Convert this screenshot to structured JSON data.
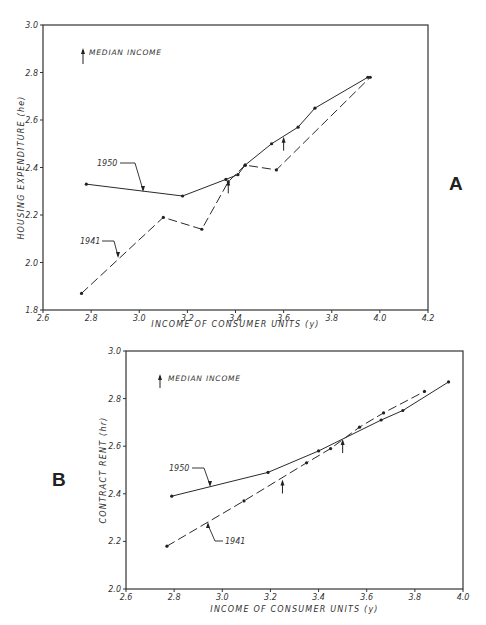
{
  "chart_data": [
    {
      "panel": "A",
      "type": "line",
      "title": "",
      "xlabel": "INCOME OF CONSUMER UNITS (y)",
      "ylabel": "HOUSING EXPENDITURE (he)",
      "xlim": [
        2.6,
        4.2
      ],
      "ylim": [
        1.8,
        3.0
      ],
      "xticks": [
        "2.6",
        "2.8",
        "3.0",
        "3.2",
        "3.4",
        "3.6",
        "3.8",
        "4.0",
        "4.2"
      ],
      "yticks": [
        "1.8",
        "2.0",
        "2.2",
        "2.4",
        "2.6",
        "2.8",
        "3.0"
      ],
      "grid": false,
      "legend": {
        "text": "MEDIAN INCOME",
        "position": "top-left",
        "marker": "up-arrow"
      },
      "series": [
        {
          "name": "1950",
          "style": "solid",
          "x": [
            2.78,
            3.18,
            3.36,
            3.41,
            3.44,
            3.55,
            3.66,
            3.73,
            3.95
          ],
          "y": [
            2.33,
            2.28,
            2.35,
            2.37,
            2.41,
            2.5,
            2.57,
            2.65,
            2.78
          ]
        },
        {
          "name": "1941",
          "style": "dashed",
          "x": [
            2.76,
            3.1,
            3.26,
            3.37,
            3.44,
            3.57,
            3.96
          ],
          "y": [
            1.87,
            2.19,
            2.14,
            2.34,
            2.41,
            2.39,
            2.78
          ]
        }
      ],
      "median_income_arrows": [
        {
          "x": 3.37,
          "y": 2.35
        },
        {
          "x": 3.6,
          "y": 2.53
        }
      ]
    },
    {
      "panel": "B",
      "type": "line",
      "title": "",
      "xlabel": "INCOME OF CONSUMER UNITS (y)",
      "ylabel": "CONTRACT RENT (hr)",
      "xlim": [
        2.6,
        4.0
      ],
      "ylim": [
        2.0,
        3.0
      ],
      "xticks": [
        "2.6",
        "2.8",
        "3.0",
        "3.2",
        "3.4",
        "3.6",
        "3.8",
        "4.0"
      ],
      "yticks": [
        "2.0",
        "2.2",
        "2.4",
        "2.6",
        "2.8",
        "3.0"
      ],
      "grid": false,
      "legend": {
        "text": "MEDIAN INCOME",
        "position": "top-left",
        "marker": "up-arrow"
      },
      "series": [
        {
          "name": "1950",
          "style": "solid",
          "x": [
            2.79,
            3.19,
            3.4,
            3.66,
            3.75,
            3.94
          ],
          "y": [
            2.39,
            2.49,
            2.58,
            2.71,
            2.75,
            2.87
          ]
        },
        {
          "name": "1941",
          "style": "dashed",
          "x": [
            2.77,
            3.09,
            3.35,
            3.45,
            3.57,
            3.67,
            3.84
          ],
          "y": [
            2.18,
            2.37,
            2.53,
            2.59,
            2.68,
            2.74,
            2.83
          ]
        }
      ],
      "median_income_arrows": [
        {
          "x": 3.25,
          "y": 2.46
        },
        {
          "x": 3.5,
          "y": 2.63
        }
      ]
    }
  ],
  "panels": {
    "a": {
      "letter": "A",
      "legend_text": "MEDIAN INCOME",
      "xlabel": "INCOME OF CONSUMER UNITS (y)",
      "ylabel": "HOUSING EXPENDITURE (he)",
      "label_1950": "1950",
      "label_1941": "1941"
    },
    "b": {
      "letter": "B",
      "legend_text": "MEDIAN INCOME",
      "xlabel": "INCOME OF CONSUMER UNITS (y)",
      "ylabel": "CONTRACT RENT (hr)",
      "label_1950": "1950",
      "label_1941": "1941"
    }
  },
  "colors": {
    "ink": "#2a2a2a",
    "axis": "#333333",
    "background": "#ffffff"
  }
}
